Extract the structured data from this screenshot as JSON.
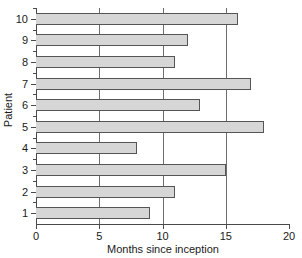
{
  "chart_data": {
    "type": "bar",
    "orientation": "horizontal",
    "title": "",
    "xlabel": "Months since inception",
    "ylabel": "Patient",
    "categories": [
      "1",
      "2",
      "3",
      "4",
      "5",
      "6",
      "7",
      "8",
      "9",
      "10"
    ],
    "values": [
      9,
      11,
      15,
      8,
      18,
      13,
      17,
      11,
      12,
      16
    ],
    "xlim": [
      0,
      20
    ],
    "xticks": [
      0,
      5,
      10,
      15,
      20
    ],
    "xticklabels": [
      "0",
      "5",
      "10",
      "15",
      "20"
    ],
    "yticklabels": [
      "1",
      "2",
      "3",
      "4",
      "5",
      "6",
      "7",
      "8",
      "9",
      "10"
    ],
    "grid": "vertical-only",
    "legend": "none",
    "bar_fill_color": "#d6d6d6",
    "bar_edge_color": "#555555",
    "axis_color": "#4a4a4a",
    "background_color": "#ffffff"
  },
  "axes": {
    "x_title": "Months since inception",
    "y_title": "Patient"
  }
}
